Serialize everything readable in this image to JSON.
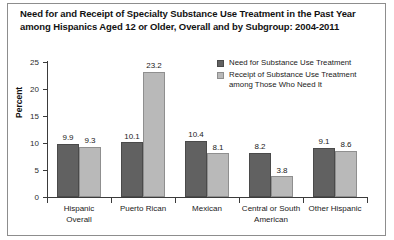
{
  "title": {
    "line1": "Need for and Receipt of Specialty Substance Use Treatment in the Past Year",
    "line2": "among Hispanics Aged 12 or Older, Overall and by Subgroup: 2004-2011"
  },
  "legend": {
    "items": [
      {
        "label": "Need for Substance Use Treatment",
        "label2": "",
        "color": "#616161"
      },
      {
        "label": "Receipt of Substance Use Treatment",
        "label2": "among Those Who Need It",
        "color": "#b9b9b9"
      }
    ]
  },
  "axis": {
    "ylabel": "Percent",
    "yticks": [
      "0",
      "5",
      "10",
      "15",
      "20",
      "25"
    ]
  },
  "chart_data": {
    "type": "bar",
    "title": "Need for and Receipt of Specialty Substance Use Treatment in the Past Year among Hispanics Aged 12 or Older, Overall and by Subgroup: 2004-2011",
    "xlabel": "",
    "ylabel": "Percent",
    "ylim": [
      0,
      25
    ],
    "yticks": [
      0,
      5,
      10,
      15,
      20,
      25
    ],
    "grid": false,
    "legend_position": "top-right",
    "categories": [
      "Hispanic Overall",
      "Puerto Rican",
      "Mexican",
      "Central or South American",
      "Other Hispanic"
    ],
    "category_lines": [
      [
        "Hispanic",
        "Overall"
      ],
      [
        "Puerto Rican"
      ],
      [
        "Mexican"
      ],
      [
        "Central or South",
        "American"
      ],
      [
        "Other Hispanic"
      ]
    ],
    "series": [
      {
        "name": "Need for Substance Use Treatment",
        "color": "#616161",
        "values": [
          9.9,
          10.1,
          10.4,
          8.2,
          9.1
        ],
        "labels": [
          "9.9",
          "10.1",
          "10.4",
          "8.2",
          "9.1"
        ]
      },
      {
        "name": "Receipt of Substance Use Treatment among Those Who Need It",
        "color": "#b9b9b9",
        "values": [
          9.3,
          23.2,
          8.1,
          3.8,
          8.6
        ],
        "labels": [
          "9.3",
          "23.2",
          "8.1",
          "3.8",
          "8.6"
        ]
      }
    ]
  }
}
